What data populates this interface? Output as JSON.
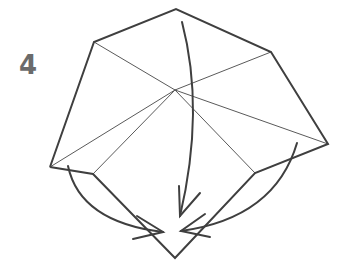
{
  "step": {
    "number": "4"
  },
  "colors": {
    "outline": "#3f3f3f",
    "crease": "#5a5a5a",
    "arrow": "#3f3f3f",
    "step_number": "#6b6b6b"
  },
  "diagram": {
    "type": "origami-fold-step",
    "vertices": {
      "top": [
        176,
        9
      ],
      "top_left": [
        94,
        42
      ],
      "top_right": [
        271,
        52
      ],
      "right": [
        328,
        144
      ],
      "inner_right": [
        255,
        173
      ],
      "bottom": [
        175,
        258
      ],
      "inner_left": [
        93,
        174
      ],
      "left": [
        50,
        167
      ],
      "center": [
        175,
        90
      ]
    },
    "arrows": [
      {
        "name": "center-fold-arrow",
        "direction": "down"
      },
      {
        "name": "left-fold-arrow",
        "direction": "down-right"
      },
      {
        "name": "right-fold-arrow",
        "direction": "down-left"
      }
    ]
  }
}
